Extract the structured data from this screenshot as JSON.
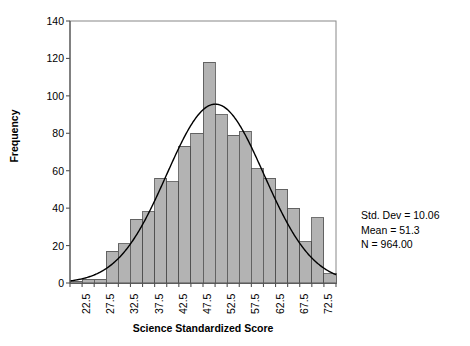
{
  "chart_data": {
    "type": "bar",
    "title": "",
    "xlabel": "Science Standardized Score",
    "ylabel": "Frequency",
    "ylim": [
      0,
      140
    ],
    "ytick_values": [
      0,
      20,
      40,
      60,
      80,
      100,
      120,
      140
    ],
    "ytick_labels": [
      "0",
      "20",
      "40",
      "60",
      "80",
      "100",
      "120",
      "140"
    ],
    "xlim": [
      21.25,
      76.25
    ],
    "xtick_labels": [
      "22.5",
      "27.5",
      "32.5",
      "37.5",
      "42.5",
      "47.5",
      "52.5",
      "57.5",
      "62.5",
      "67.5",
      "72.5"
    ],
    "xtick_values": [
      22.5,
      27.5,
      32.5,
      37.5,
      42.5,
      47.5,
      52.5,
      57.5,
      62.5,
      67.5,
      72.5
    ],
    "bin_width": 2.5,
    "grid": false,
    "legend": false,
    "bar_fill": "#b3b3b3",
    "bar_edge": "#4d4d4d",
    "curve_color": "#000000",
    "curve_type": "normal",
    "categories": [
      22.5,
      25.0,
      27.5,
      30.0,
      32.5,
      35.0,
      37.5,
      40.0,
      42.5,
      45.0,
      47.5,
      50.0,
      52.5,
      55.0,
      57.5,
      60.0,
      62.5,
      65.0,
      67.5,
      70.0,
      72.5,
      75.0
    ],
    "values": [
      1,
      2,
      2,
      17,
      21,
      34,
      38,
      56,
      54,
      73,
      80,
      118,
      90,
      79,
      81,
      61,
      56,
      50,
      40,
      22,
      35,
      5
    ],
    "annotations": {
      "std_dev": "Std. Dev = 10.06",
      "mean": "Mean = 51.3",
      "n": "N = 964.00"
    },
    "stats": {
      "std_dev": 10.06,
      "mean": 51.3,
      "n": 964.0
    }
  }
}
